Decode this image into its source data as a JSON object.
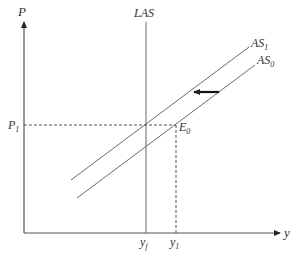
{
  "diagram": {
    "type": "economics-as-las",
    "axes": {
      "y_label": "P",
      "x_label": "y"
    },
    "curves": [
      {
        "id": "LAS",
        "label": "LAS",
        "kind": "vertical"
      },
      {
        "id": "AS1",
        "label": "AS",
        "subscript": "1",
        "kind": "upward-sloping"
      },
      {
        "id": "AS0",
        "label": "AS",
        "subscript": "0",
        "kind": "upward-sloping"
      }
    ],
    "points": [
      {
        "label": "E",
        "subscript": "0"
      }
    ],
    "price_levels": [
      {
        "label": "P",
        "subscript": "1"
      }
    ],
    "output_levels": [
      {
        "label": "y",
        "subscript": "f"
      },
      {
        "label": "y",
        "subscript": "1"
      }
    ],
    "shift_arrow": {
      "direction": "left",
      "from": "AS0",
      "to": "AS1"
    },
    "colors": {
      "lines": "#6b6b6b",
      "axis": "#555555",
      "arrow": "#111111",
      "text": "#333333"
    }
  }
}
